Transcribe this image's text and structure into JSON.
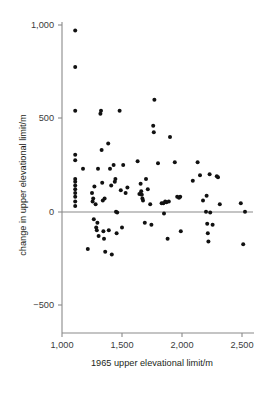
{
  "chart_data": {
    "type": "scatter",
    "title": "",
    "xlabel": "1965 upper elevational limit/m",
    "ylabel": "change in upper elevational limit/m",
    "xlim": [
      950,
      2560
    ],
    "ylim": [
      -640,
      1055
    ],
    "xticks": [
      1000,
      1500,
      2000,
      2500
    ],
    "xtick_labels": [
      "1,000",
      "1,500",
      "2,000",
      "2,500"
    ],
    "yticks": [
      -500,
      0,
      500,
      1000
    ],
    "ytick_labels": [
      "−500",
      "0",
      "500",
      "1,000"
    ],
    "grid": false,
    "legend": null,
    "zero_line": 0,
    "marker": "filled-circle",
    "marker_color": "#111111",
    "axis_color": "#8a8a8a",
    "points": [
      [
        1110,
        970
      ],
      [
        1110,
        775
      ],
      [
        1110,
        540
      ],
      [
        1110,
        305
      ],
      [
        1110,
        275
      ],
      [
        1110,
        175
      ],
      [
        1110,
        160
      ],
      [
        1110,
        140
      ],
      [
        1110,
        120
      ],
      [
        1110,
        100
      ],
      [
        1110,
        80
      ],
      [
        1110,
        55
      ],
      [
        1110,
        30
      ],
      [
        1175,
        230
      ],
      [
        1215,
        -200
      ],
      [
        1250,
        100
      ],
      [
        1255,
        55
      ],
      [
        1260,
        70
      ],
      [
        1265,
        -40
      ],
      [
        1270,
        135
      ],
      [
        1280,
        40
      ],
      [
        1285,
        -85
      ],
      [
        1290,
        -100
      ],
      [
        1295,
        -60
      ],
      [
        1300,
        230
      ],
      [
        1305,
        -130
      ],
      [
        1320,
        525
      ],
      [
        1325,
        540
      ],
      [
        1330,
        330
      ],
      [
        1335,
        155
      ],
      [
        1340,
        60
      ],
      [
        1345,
        -105
      ],
      [
        1350,
        -145
      ],
      [
        1355,
        70
      ],
      [
        1360,
        -215
      ],
      [
        1385,
        365
      ],
      [
        1390,
        -100
      ],
      [
        1400,
        230
      ],
      [
        1410,
        140
      ],
      [
        1415,
        -230
      ],
      [
        1430,
        250
      ],
      [
        1440,
        160
      ],
      [
        1445,
        175
      ],
      [
        1450,
        0
      ],
      [
        1455,
        -115
      ],
      [
        1460,
        -5
      ],
      [
        1480,
        540
      ],
      [
        1490,
        115
      ],
      [
        1500,
        -85
      ],
      [
        1510,
        250
      ],
      [
        1530,
        100
      ],
      [
        1545,
        130
      ],
      [
        1630,
        270
      ],
      [
        1645,
        95
      ],
      [
        1655,
        150
      ],
      [
        1660,
        110
      ],
      [
        1665,
        90
      ],
      [
        1670,
        70
      ],
      [
        1675,
        60
      ],
      [
        1690,
        -60
      ],
      [
        1700,
        175
      ],
      [
        1715,
        120
      ],
      [
        1735,
        40
      ],
      [
        1745,
        -70
      ],
      [
        1760,
        460
      ],
      [
        1765,
        425
      ],
      [
        1770,
        600
      ],
      [
        1800,
        260
      ],
      [
        1830,
        45
      ],
      [
        1845,
        45
      ],
      [
        1850,
        -10
      ],
      [
        1860,
        55
      ],
      [
        1870,
        50
      ],
      [
        1880,
        -145
      ],
      [
        1890,
        55
      ],
      [
        1900,
        400
      ],
      [
        1940,
        265
      ],
      [
        1960,
        80
      ],
      [
        1975,
        75
      ],
      [
        1985,
        80
      ],
      [
        1990,
        -105
      ],
      [
        2090,
        165
      ],
      [
        2130,
        265
      ],
      [
        2150,
        195
      ],
      [
        2175,
        60
      ],
      [
        2200,
        0
      ],
      [
        2205,
        85
      ],
      [
        2210,
        -65
      ],
      [
        2215,
        -115
      ],
      [
        2220,
        -160
      ],
      [
        2230,
        200
      ],
      [
        2235,
        -5
      ],
      [
        2255,
        -70
      ],
      [
        2290,
        190
      ],
      [
        2300,
        185
      ],
      [
        2315,
        40
      ],
      [
        2490,
        45
      ],
      [
        2510,
        -175
      ],
      [
        2525,
        0
      ]
    ]
  },
  "axes": {
    "x_axis_name": "x-axis",
    "y_axis_name": "y-axis"
  }
}
